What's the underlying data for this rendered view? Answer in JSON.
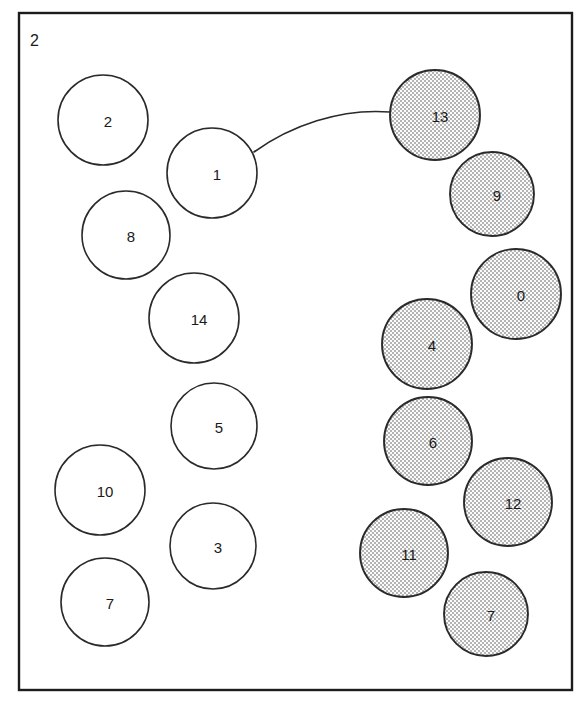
{
  "figure": {
    "panel_label": "2",
    "background_color": "#ffffff",
    "border_color": "#1c1c1c",
    "stroke_color": "#2a2a2a",
    "shaded_fill_color": "#e8e8e8",
    "open_fill_color": "#ffffff",
    "panel": {
      "x": 19,
      "y": 13,
      "width": 553,
      "height": 677
    }
  },
  "nodes": [
    {
      "id": "n2",
      "label": "2",
      "cx": 103,
      "cy": 120,
      "r": 45,
      "style": "open"
    },
    {
      "id": "n1",
      "label": "1",
      "cx": 212,
      "cy": 173,
      "r": 45,
      "style": "open"
    },
    {
      "id": "n8",
      "label": "8",
      "cx": 126,
      "cy": 235,
      "r": 44,
      "style": "open"
    },
    {
      "id": "n14",
      "label": "14",
      "cx": 194,
      "cy": 318,
      "r": 45,
      "style": "open"
    },
    {
      "id": "n5",
      "label": "5",
      "cx": 214,
      "cy": 426,
      "r": 43,
      "style": "open"
    },
    {
      "id": "n10",
      "label": "10",
      "cx": 100,
      "cy": 490,
      "r": 45,
      "style": "open"
    },
    {
      "id": "n3",
      "label": "3",
      "cx": 213,
      "cy": 546,
      "r": 43,
      "style": "open"
    },
    {
      "id": "n7a",
      "label": "7",
      "cx": 105,
      "cy": 602,
      "r": 44,
      "style": "open"
    },
    {
      "id": "n13",
      "label": "13",
      "cx": 435,
      "cy": 115,
      "r": 45,
      "style": "shaded"
    },
    {
      "id": "n9",
      "label": "9",
      "cx": 492,
      "cy": 194,
      "r": 42,
      "style": "shaded"
    },
    {
      "id": "n0",
      "label": "0",
      "cx": 516,
      "cy": 294,
      "r": 45,
      "style": "shaded"
    },
    {
      "id": "n4",
      "label": "4",
      "cx": 427,
      "cy": 344,
      "r": 45,
      "style": "shaded"
    },
    {
      "id": "n6",
      "label": "6",
      "cx": 428,
      "cy": 441,
      "r": 44,
      "style": "shaded"
    },
    {
      "id": "n12",
      "label": "12",
      "cx": 508,
      "cy": 502,
      "r": 44,
      "style": "shaded"
    },
    {
      "id": "n11",
      "label": "11",
      "cx": 404,
      "cy": 553,
      "r": 44,
      "style": "shaded"
    },
    {
      "id": "n7b",
      "label": "7",
      "cx": 486,
      "cy": 614,
      "r": 42,
      "style": "shaded"
    }
  ],
  "edges": [
    {
      "id": "e1-13",
      "from": "n1",
      "to": "n13",
      "path": "M 254 152 C 290 126 340 108 390 112"
    }
  ]
}
